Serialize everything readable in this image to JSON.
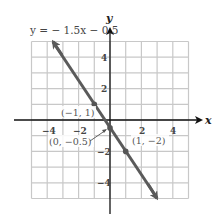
{
  "chart_data": {
    "type": "line",
    "title": "y = − 1.5x − 0.5",
    "xlabel": "x",
    "ylabel": "y",
    "xlim": [
      -5,
      5
    ],
    "ylim": [
      -5,
      5
    ],
    "grid": true,
    "x_ticks": [
      -4,
      -2,
      2,
      4
    ],
    "y_ticks": [
      4,
      2,
      -2,
      -4
    ],
    "x_tick_labels": [
      "−4",
      "−2",
      "2",
      "4"
    ],
    "y_tick_labels": [
      "4",
      "2",
      "−2",
      "−4"
    ],
    "series": [
      {
        "name": "y = −1.5x − 0.5",
        "slope": -1.5,
        "intercept": -0.5,
        "x": [
          -3.67,
          3
        ],
        "y": [
          5,
          -5
        ],
        "color": "#5a5a5a"
      }
    ],
    "points": [
      {
        "x": -1,
        "y": 1,
        "label": "(−1, 1)"
      },
      {
        "x": 0,
        "y": -0.5,
        "label": "(0, −0.5)"
      },
      {
        "x": 1,
        "y": -2,
        "label": "(1, −2)"
      }
    ],
    "legend": "none"
  },
  "labels": {
    "equation": "y = − 1.5x − 0.5",
    "x_axis": "x",
    "y_axis": "y",
    "point_a": "(−1, 1)",
    "point_b": "(0, −0.5)",
    "point_c": "(1, −2)",
    "tick_x_m4": "−4",
    "tick_x_m2": "−2",
    "tick_x_2": "2",
    "tick_x_4": "4",
    "tick_y_4": "4",
    "tick_y_2": "2",
    "tick_y_m2": "−2",
    "tick_y_m4": "−4"
  }
}
